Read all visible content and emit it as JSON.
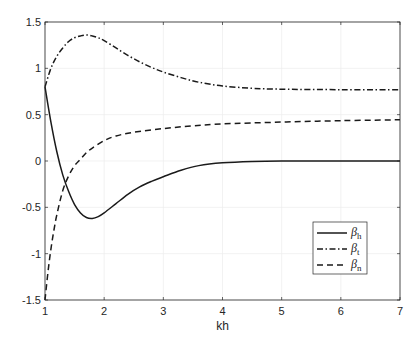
{
  "chart_data": {
    "type": "line",
    "title": "",
    "xlabel": "kh",
    "ylabel": "",
    "xlim": [
      1,
      7
    ],
    "ylim": [
      -1.5,
      1.5
    ],
    "xticks": [
      1,
      2,
      3,
      4,
      5,
      6,
      7
    ],
    "yticks": [
      -1.5,
      -1,
      -0.5,
      0,
      0.5,
      1,
      1.5
    ],
    "xtick_labels": [
      "1",
      "2",
      "3",
      "4",
      "5",
      "6",
      "7"
    ],
    "ytick_labels": [
      "-1.5",
      "-1",
      "-0.5",
      "0",
      "0.5",
      "1",
      "1.5"
    ],
    "grid": true,
    "legend_position": "lower right",
    "series": [
      {
        "name": "β_h",
        "symbol": "β",
        "subscript": "h",
        "style": "solid",
        "x": [
          1.0,
          1.1,
          1.2,
          1.3,
          1.4,
          1.5,
          1.6,
          1.7,
          1.8,
          1.9,
          2.0,
          2.2,
          2.4,
          2.6,
          2.8,
          3.0,
          3.3,
          3.6,
          4.0,
          4.5,
          5.0,
          6.0,
          7.0
        ],
        "y": [
          0.8,
          0.42,
          0.1,
          -0.15,
          -0.33,
          -0.47,
          -0.56,
          -0.61,
          -0.62,
          -0.6,
          -0.56,
          -0.46,
          -0.36,
          -0.28,
          -0.22,
          -0.17,
          -0.1,
          -0.05,
          -0.02,
          -0.005,
          0.0,
          0.0,
          0.0
        ]
      },
      {
        "name": "β_t",
        "symbol": "β",
        "subscript": "t",
        "style": "dashdot",
        "x": [
          1.0,
          1.1,
          1.2,
          1.3,
          1.4,
          1.5,
          1.6,
          1.7,
          1.8,
          1.9,
          2.0,
          2.2,
          2.4,
          2.6,
          2.8,
          3.0,
          3.3,
          3.6,
          4.0,
          4.5,
          5.0,
          6.0,
          7.0
        ],
        "y": [
          0.8,
          1.0,
          1.13,
          1.22,
          1.29,
          1.33,
          1.35,
          1.36,
          1.35,
          1.33,
          1.3,
          1.22,
          1.14,
          1.07,
          1.01,
          0.96,
          0.9,
          0.85,
          0.81,
          0.785,
          0.775,
          0.77,
          0.77
        ]
      },
      {
        "name": "β_n",
        "symbol": "β",
        "subscript": "n",
        "style": "dashed",
        "x": [
          1.0,
          1.05,
          1.1,
          1.15,
          1.2,
          1.3,
          1.4,
          1.5,
          1.6,
          1.7,
          1.8,
          2.0,
          2.2,
          2.5,
          3.0,
          3.5,
          4.0,
          5.0,
          6.0,
          7.0
        ],
        "y": [
          -1.5,
          -1.2,
          -0.95,
          -0.75,
          -0.58,
          -0.32,
          -0.16,
          -0.05,
          0.02,
          0.09,
          0.14,
          0.22,
          0.27,
          0.31,
          0.35,
          0.38,
          0.4,
          0.42,
          0.435,
          0.445
        ]
      }
    ]
  },
  "legend": {
    "items": [
      {
        "symbol": "β",
        "sub": "h"
      },
      {
        "symbol": "β",
        "sub": "t"
      },
      {
        "symbol": "β",
        "sub": "n"
      }
    ]
  },
  "colors": {
    "line": "#1a1a1a",
    "axis": "#262626",
    "grid": "#ededed",
    "legend_border": "#262626"
  }
}
